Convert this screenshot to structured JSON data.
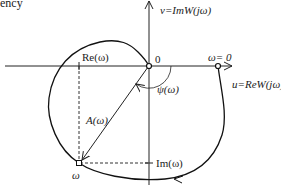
{
  "title_fragment": "ency",
  "axes": {
    "vertical_label": "v=ImW(jω)",
    "horizontal_label": "u=ReW(jω)",
    "origin_label": "0"
  },
  "points": {
    "omega_zero_label": "ω= 0",
    "omega_label": "ω"
  },
  "annotations": {
    "real_part": "Re(ω)",
    "imag_part": "Im(ω)",
    "amplitude": "A(ω)",
    "phase": "ψ(ω)"
  },
  "colors": {
    "line": "#222222",
    "background": "#ffffff"
  }
}
